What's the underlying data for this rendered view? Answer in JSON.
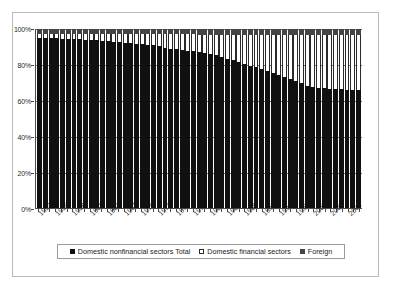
{
  "chart_data": {
    "type": "bar",
    "subtype": "100% stacked column",
    "title": "",
    "xlabel": "",
    "ylabel": "",
    "ylim": [
      0,
      100
    ],
    "ytick_labels": [
      "0%",
      "20%",
      "40%",
      "60%",
      "80%",
      "100%"
    ],
    "ytick_values": [
      0,
      20,
      40,
      60,
      80,
      100
    ],
    "grid": true,
    "legend_position": "bottom",
    "categories": [
      "1952",
      "1953",
      "1954",
      "1955",
      "1956",
      "1957",
      "1958",
      "1959",
      "1960",
      "1961",
      "1962",
      "1963",
      "1964",
      "1965",
      "1966",
      "1967",
      "1968",
      "1969",
      "1970",
      "1971",
      "1972",
      "1973",
      "1974",
      "1975",
      "1976",
      "1977",
      "1978",
      "1979",
      "1980",
      "1981",
      "1982",
      "1983",
      "1984",
      "1985",
      "1986",
      "1987",
      "1988",
      "1989",
      "1990",
      "1991",
      "1992",
      "1993",
      "1994",
      "1995",
      "1996",
      "1997",
      "1998",
      "1999",
      "2000",
      "2001",
      "2002",
      "2003",
      "2004",
      "2005",
      "2006",
      "2007",
      "2008"
    ],
    "xtick_labels": [
      "1952",
      "1955",
      "1958",
      "1961",
      "1964",
      "1967",
      "1970",
      "1973",
      "1976",
      "1979",
      "1982",
      "1985",
      "1988",
      "1991",
      "1994",
      "1997",
      "2000",
      "2003",
      "2006"
    ],
    "series": [
      {
        "name": "Domestic nonfinancial sectors Total",
        "color": "#101010",
        "values": [
          95.0,
          95.0,
          94.8,
          94.7,
          94.6,
          94.5,
          94.4,
          94.2,
          94.0,
          93.9,
          93.7,
          93.5,
          93.3,
          93.0,
          92.7,
          92.4,
          92.0,
          91.6,
          91.4,
          91.2,
          90.9,
          90.4,
          89.6,
          89.0,
          88.6,
          88.3,
          87.7,
          87.6,
          87.3,
          86.8,
          86.0,
          85.2,
          84.4,
          83.5,
          82.5,
          81.6,
          80.6,
          79.6,
          78.5,
          77.6,
          76.7,
          75.6,
          74.4,
          73.1,
          71.9,
          70.7,
          69.6,
          68.4,
          67.8,
          67.2,
          66.8,
          66.6,
          66.4,
          66.3,
          66.2,
          66.1,
          66.0
        ]
      },
      {
        "name": "Domestic financial sectors",
        "color": "#ffffff",
        "values": [
          2.2,
          2.3,
          2.5,
          2.6,
          2.7,
          2.8,
          2.9,
          3.1,
          3.3,
          3.4,
          3.6,
          3.8,
          4.0,
          4.3,
          4.6,
          4.9,
          5.3,
          5.7,
          5.9,
          6.1,
          6.4,
          6.9,
          7.6,
          8.2,
          8.5,
          8.7,
          9.3,
          9.4,
          9.6,
          10.1,
          10.8,
          11.6,
          12.4,
          13.3,
          14.3,
          15.2,
          16.2,
          17.2,
          18.3,
          19.2,
          20.1,
          21.2,
          22.4,
          23.7,
          24.9,
          26.1,
          27.2,
          28.4,
          29.0,
          29.6,
          30.0,
          30.2,
          30.4,
          30.5,
          30.6,
          30.7,
          30.8
        ]
      },
      {
        "name": "Foreign",
        "color": "#454545",
        "values": [
          2.8,
          2.7,
          2.7,
          2.7,
          2.7,
          2.7,
          2.7,
          2.7,
          2.7,
          2.7,
          2.7,
          2.7,
          2.7,
          2.7,
          2.7,
          2.7,
          2.7,
          2.7,
          2.7,
          2.7,
          2.7,
          2.7,
          2.8,
          2.8,
          2.9,
          3.0,
          3.0,
          3.0,
          3.1,
          3.1,
          3.2,
          3.2,
          3.2,
          3.2,
          3.2,
          3.2,
          3.2,
          3.2,
          3.2,
          3.2,
          3.2,
          3.2,
          3.2,
          3.2,
          3.2,
          3.2,
          3.2,
          3.2,
          3.2,
          3.2,
          3.2,
          3.2,
          3.2,
          3.2,
          3.2,
          3.2,
          3.2
        ]
      }
    ]
  },
  "legend": {
    "items": [
      {
        "label": "Domestic nonfinancial sectors Total",
        "swatch": "swatch-nonfin"
      },
      {
        "label": "Domestic financial sectors",
        "swatch": "swatch-fin"
      },
      {
        "label": "Foreign",
        "swatch": "swatch-foreign"
      }
    ]
  }
}
